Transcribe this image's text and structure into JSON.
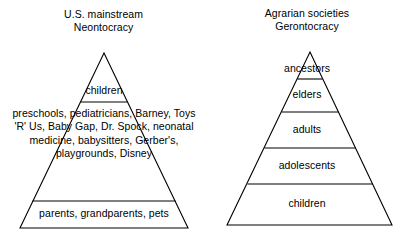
{
  "pyramids": [
    {
      "id": "left",
      "caption_line1": "U.S. mainstream",
      "caption_line2": "Neontocracy",
      "bands": [
        {
          "name": "children",
          "label": "children"
        },
        {
          "name": "consumer-culture",
          "label": "preschools, pediatricians, Barney, Toys 'R' Us, Baby Gap, Dr. Spock, neonatal medicine, babysitters, Gerber's, playgrounds, Disney"
        },
        {
          "name": "parents",
          "label": "parents, grandparents, pets"
        }
      ]
    },
    {
      "id": "right",
      "caption_line1": "Agrarian societies",
      "caption_line2": "Gerontocracy",
      "bands": [
        {
          "name": "ancestors",
          "label": "ancestors"
        },
        {
          "name": "elders",
          "label": "elders"
        },
        {
          "name": "adults",
          "label": "adults"
        },
        {
          "name": "adolescents",
          "label": "adolescents"
        },
        {
          "name": "children",
          "label": "children"
        }
      ]
    }
  ],
  "style": {
    "stroke_color": "#000000",
    "fill_color": "#ffffff",
    "text_color": "#000000"
  }
}
